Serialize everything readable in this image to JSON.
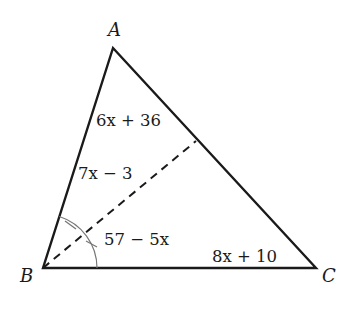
{
  "diagram": {
    "type": "triangle",
    "vertices": [
      {
        "id": "A",
        "label": "A",
        "x": 113,
        "y": 48,
        "label_x": 108,
        "label_y": 36
      },
      {
        "id": "B",
        "label": "B",
        "x": 43,
        "y": 268,
        "label_x": 20,
        "label_y": 282
      },
      {
        "id": "C",
        "label": "C",
        "x": 316,
        "y": 268,
        "label_x": 322,
        "label_y": 282
      }
    ],
    "bisector": {
      "from": "B",
      "to_x": 196,
      "to_y": 141,
      "style": "dashed"
    },
    "angle_labels": [
      {
        "id": "angle-A",
        "text": "6x + 36",
        "x": 96,
        "y": 126
      },
      {
        "id": "angle-ABD",
        "text": "7x − 3",
        "x": 78,
        "y": 179
      },
      {
        "id": "angle-DBC",
        "text": "57 − 5x",
        "x": 104,
        "y": 245
      },
      {
        "id": "angle-C",
        "text": "8x + 10",
        "x": 212,
        "y": 262
      }
    ],
    "stroke_color": "#1a1a1a",
    "arc_color": "#666666"
  }
}
